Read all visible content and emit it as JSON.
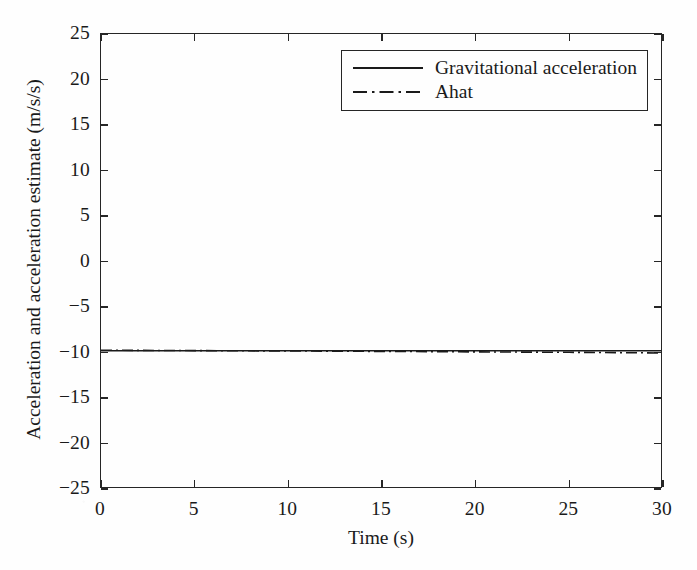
{
  "chart_data": {
    "type": "line",
    "title": "",
    "xlabel": "Time (s)",
    "ylabel": "Acceleration and acceleration estimate (m/s/s)",
    "xlim": [
      0,
      30
    ],
    "ylim": [
      -25,
      25
    ],
    "xticks": [
      0,
      5,
      10,
      15,
      20,
      25,
      30
    ],
    "yticks": [
      25,
      20,
      15,
      10,
      5,
      0,
      -5,
      -10,
      -15,
      -20,
      -25
    ],
    "xtick_labels": [
      "0",
      "5",
      "10",
      "15",
      "20",
      "25",
      "30"
    ],
    "ytick_labels": [
      "25",
      "20",
      "15",
      "10",
      "5",
      "0",
      "−5",
      "−10",
      "−15",
      "−20",
      "−25"
    ],
    "grid": false,
    "legend_position": "upper right",
    "series": [
      {
        "name": "Gravitational acceleration",
        "style": "solid",
        "color": "#1a1a1a",
        "x": [
          0,
          5,
          10,
          15,
          20,
          25,
          30
        ],
        "values": [
          -9.81,
          -9.81,
          -9.81,
          -9.81,
          -9.81,
          -9.81,
          -9.81
        ]
      },
      {
        "name": "Ahat",
        "style": "dash-dot",
        "color": "#1a1a1a",
        "x": [
          0,
          5,
          10,
          15,
          20,
          25,
          30
        ],
        "values": [
          -9.75,
          -9.79,
          -9.83,
          -9.88,
          -9.93,
          -9.98,
          -10.05
        ]
      }
    ],
    "annotations": []
  },
  "legend": {
    "items": [
      {
        "label": "Gravitational acceleration",
        "style": "solid"
      },
      {
        "label": "Ahat",
        "style": "dash-dot"
      }
    ]
  },
  "axes": {
    "x_title": "Time (s)",
    "y_title": "Acceleration and acceleration estimate (m/s/s)"
  },
  "colors": {
    "line": "#1a1a1a",
    "axis": "#262626",
    "background": "#fefefe"
  }
}
